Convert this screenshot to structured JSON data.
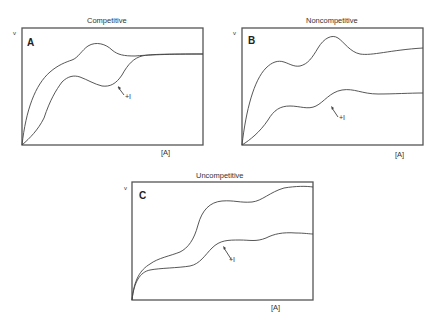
{
  "figure": {
    "panels": [
      {
        "id": "A",
        "title": "Competitive",
        "letter": "A",
        "y_axis_label": "v",
        "x_axis_label": "[A]",
        "inhibitor_label": "+I",
        "curves": [
          "uninhibited",
          "inhibited (+I)"
        ]
      },
      {
        "id": "B",
        "title": "Noncompetitive",
        "letter": "B",
        "y_axis_label": "v",
        "x_axis_label": "[A]",
        "inhibitor_label": "+I",
        "curves": [
          "uninhibited",
          "inhibited (+I)"
        ]
      },
      {
        "id": "C",
        "title": "Uncompetitive",
        "letter": "C",
        "y_axis_label": "v",
        "x_axis_label": "[A]",
        "inhibitor_label": "+I",
        "curves": [
          "uninhibited",
          "inhibited (+I)"
        ]
      }
    ]
  }
}
